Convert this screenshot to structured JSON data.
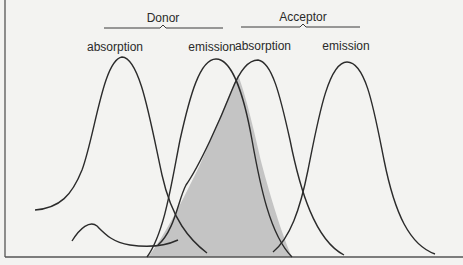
{
  "diagram": {
    "groups": [
      {
        "label": "Donor",
        "x": 163,
        "y": 17
      },
      {
        "label": "Acceptor",
        "x": 303,
        "y": 17
      }
    ],
    "curve_labels": [
      {
        "label": "absorption",
        "x": 122,
        "y": 50
      },
      {
        "label": "emission",
        "x": 215,
        "y": 50
      },
      {
        "label": "absorption",
        "x": 266,
        "y": 50
      },
      {
        "label": "emission",
        "x": 347,
        "y": 50
      }
    ],
    "shaded_region": {
      "name": "spectral overlap",
      "color": "#c4c4c4"
    },
    "colors": {
      "background": "#f3f3f1",
      "line": "#2b2b2b",
      "overlap": "#c4c4c4"
    }
  }
}
